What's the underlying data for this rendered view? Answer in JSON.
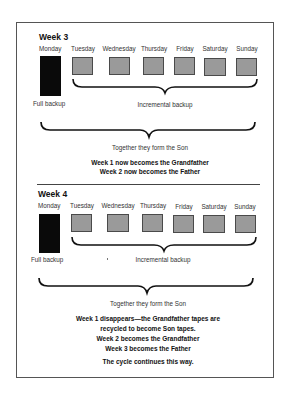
{
  "weeks": [
    {
      "title": "Week 3",
      "days": [
        "Monday",
        "Tuesday",
        "Wednesday",
        "Thursday",
        "Friday",
        "Saturday",
        "Sunday"
      ],
      "full_label": "Full backup",
      "incremental_label": "Incremental backup",
      "together_label": "Together they form the Son",
      "notes": [
        "Week 1 now becomes the Grandfather",
        "Week 2 now becomes the Father"
      ]
    },
    {
      "title": "Week 4",
      "days": [
        "Monday",
        "Tuesday",
        "Wednesday",
        "Thursday",
        "Friday",
        "Saturday",
        "Sunday"
      ],
      "full_label": "Full backup",
      "incremental_label": "Incremental backup",
      "together_label": "Together they form the Son",
      "notes": [
        "Week 1 disappears—the Grandfather tapes are",
        "recycled to become Son tapes.",
        "Week 2 becomes the Grandfather",
        "Week 3 becomes the Father"
      ],
      "closing": "The cycle continues this way."
    }
  ],
  "colors": {
    "full_backup": "#0a0a0a",
    "incremental_backup": "#9a9a9a",
    "border": "#4a4a4a"
  }
}
